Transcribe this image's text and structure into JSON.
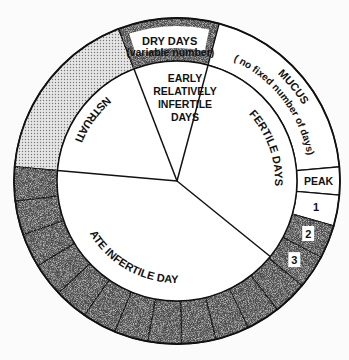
{
  "geometry": {
    "cx": 177,
    "cy": 181,
    "r_outer": 163,
    "r_inner": 120
  },
  "colors": {
    "background": "#fbfbfb",
    "line": "#111111",
    "dark_fill": "#4a4a4a",
    "light_dot_fill": "#d4d4d4",
    "white_fill": "#ffffff"
  },
  "sectors": [
    {
      "id": "menstruation",
      "label": "MENSTRUATION",
      "start": 185,
      "end": 249,
      "fill": "dotted"
    },
    {
      "id": "dry-days",
      "label": "DRY DAYS",
      "sublabel": "(variable number)",
      "start": 249,
      "end": 285,
      "fill": "dark"
    },
    {
      "id": "mucus",
      "label": "MUCUS",
      "sublabel": "( no fixed number of days)",
      "start": 285,
      "end": 355,
      "fill": "white"
    },
    {
      "id": "peak",
      "label": "PEAK",
      "start": 355,
      "end": 365,
      "fill": "white"
    },
    {
      "id": "day-1",
      "label": "1",
      "start": 365,
      "end": 376,
      "fill": "white"
    },
    {
      "id": "day-2",
      "label": "2",
      "start": 376,
      "end": 388,
      "fill": "dark"
    },
    {
      "id": "day-3",
      "label": "3",
      "start": 388,
      "end": 400,
      "fill": "dark"
    }
  ],
  "late_segments": {
    "start": 400,
    "end": 545,
    "count": 12,
    "fill": "dark"
  },
  "inner_regions": [
    {
      "id": "early-infertile",
      "lines": [
        "EARLY",
        "RELATIVELY",
        "INFERTILE",
        "DAYS"
      ]
    },
    {
      "id": "fertile-days",
      "label": "FERTILE DAYS"
    },
    {
      "id": "late-infertile",
      "label": "LATE INFERTILE DAYS"
    }
  ],
  "inner_dividers": [
    185,
    249,
    285,
    399
  ]
}
